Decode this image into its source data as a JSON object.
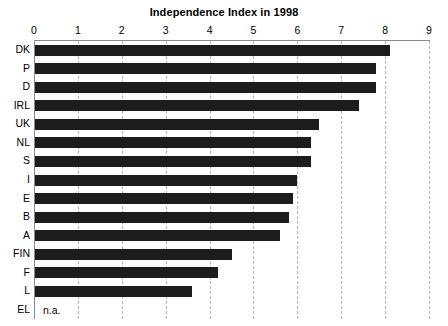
{
  "chart_data": {
    "type": "bar",
    "orientation": "horizontal",
    "title": "Independence Index in 1998",
    "xlabel": "",
    "ylabel": "",
    "xlim": [
      0,
      9
    ],
    "xticks": [
      0,
      1,
      2,
      3,
      4,
      5,
      6,
      7,
      8,
      9
    ],
    "xtick_labels": [
      "0",
      "1",
      "2",
      "3",
      "4",
      "5",
      "6",
      "7",
      "8",
      "9"
    ],
    "grid": true,
    "grid_axis": "x",
    "grid_style": "dashed",
    "legend": false,
    "bar_color": "#1c1c1c",
    "categories": [
      "DK",
      "P",
      "D",
      "IRL",
      "UK",
      "NL",
      "S",
      "I",
      "E",
      "B",
      "A",
      "FIN",
      "F",
      "L",
      "EL"
    ],
    "values": [
      8.1,
      7.8,
      7.8,
      7.4,
      6.5,
      6.3,
      6.3,
      6.0,
      5.9,
      5.8,
      5.6,
      4.5,
      4.2,
      3.6,
      null
    ],
    "annotations": [
      {
        "category": "EL",
        "text": "n.a."
      }
    ]
  },
  "chart": {
    "title": "Independence Index in 1998",
    "na_text": "n.a."
  }
}
